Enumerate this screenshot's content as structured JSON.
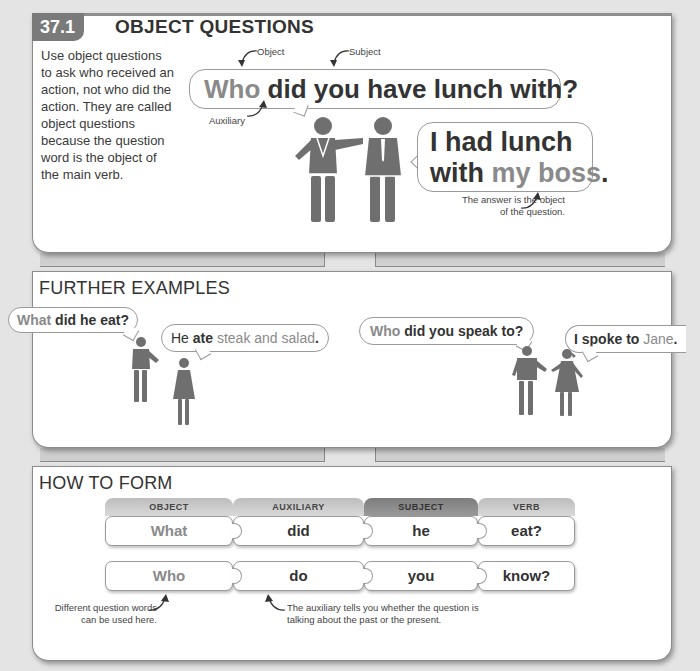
{
  "section1": {
    "number": "37.1",
    "title": "OBJECT QUESTIONS",
    "intro": "Use object questions to ask who received an action, not who did the action. They are called object questions because the question word is the object of the main verb.",
    "question": {
      "object_word": "Who",
      "rest": "did you have lunch with?"
    },
    "labels": {
      "object": "Object",
      "subject": "Subject",
      "auxiliary": "Auxiliary"
    },
    "answer": {
      "line1": "I had lunch",
      "line2_bold": "with",
      "line2_light": "my boss",
      "line2_end": "."
    },
    "answer_note": "The answer is the object of the question."
  },
  "section2": {
    "title": "FURTHER EXAMPLES",
    "examples": [
      {
        "q_light": "What",
        "q_bold": "did he eat?",
        "a_bold1": "He",
        "a_bold2": "ate",
        "a_light": "steak and salad",
        "a_end": "."
      },
      {
        "q_light": "Who",
        "q_bold": "did you speak to?",
        "a_bold1": "I spoke to",
        "a_light": "Jane",
        "a_end": "."
      }
    ]
  },
  "section3": {
    "title": "HOW TO FORM",
    "columns": [
      "OBJECT",
      "AUXILIARY",
      "SUBJECT",
      "VERB"
    ],
    "rows": [
      [
        "What",
        "did",
        "he",
        "eat?"
      ],
      [
        "Who",
        "do",
        "you",
        "know?"
      ]
    ],
    "note_left": "Different question words can be used here.",
    "note_right": "The auxiliary tells you whether the question is talking about the past or the present."
  },
  "colors": {
    "figure": "#6f6f6f",
    "accent_gray": "#8a8a8a",
    "text": "#333333",
    "badge": "#7a7a7a"
  }
}
